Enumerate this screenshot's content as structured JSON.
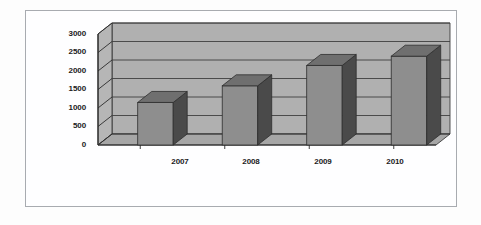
{
  "page": {
    "background_color": "#fdfdfd",
    "frame_border_color": "#a8abb0",
    "bleed_lines": [
      "of the company for the period 2007-2010",
      "sales  revenue  figures",
      "produced",
      "the  following  results  were  obtained  in  the  survey",
      "and  the  growth  of  both  small  and  large  business  enterprises",
      "in  the  last  years  over  2000  were  reported"
    ]
  },
  "chart_data": {
    "type": "bar",
    "title": "",
    "subtitle": "",
    "xlabel": "",
    "ylabel": "",
    "categories": [
      "2007",
      "2008",
      "2009",
      "2010"
    ],
    "values": [
      1150,
      1600,
      2150,
      2400
    ],
    "series": [
      {
        "name": "Series 1",
        "values": [
          1150,
          1600,
          2150,
          2400
        ]
      }
    ],
    "ylim": [
      0,
      3000
    ],
    "ytick_labels": [
      "0",
      "500",
      "1000",
      "1500",
      "2000",
      "2500",
      "3000"
    ],
    "ytick_values": [
      0,
      500,
      1000,
      1500,
      2000,
      2500,
      3000
    ],
    "grid": true,
    "grid_axis": "y",
    "legend": false,
    "legend_position": "none",
    "style": "3d",
    "colors": {
      "bar_front": "#8e8e8e",
      "bar_side": "#4a4a4a",
      "bar_top": "#6f6f6f",
      "plot_area": "#b6b6b6",
      "wall_back": "#b0b0b0",
      "floor": "#a6a6a6",
      "gridline": "#3f3f3f",
      "axis": "#2b2b2b",
      "text": "#1b1b1b"
    }
  }
}
